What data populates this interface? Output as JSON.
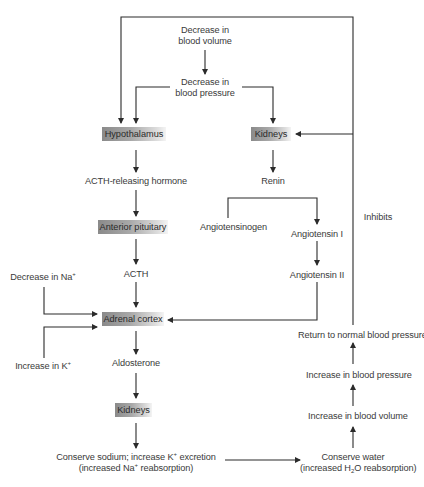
{
  "diagram": {
    "nodes": {
      "decrease_blood_volume": {
        "line1": "Decrease in",
        "line2": "blood volume"
      },
      "decrease_blood_pressure": {
        "line1": "Decrease in",
        "line2": "blood pressure"
      },
      "hypothalamus": "Hypothalamus",
      "kidneys_top": "Kidneys",
      "acth_releasing_hormone": "ACTH-releasing hormone",
      "renin": "Renin",
      "anterior_pituitary": "Anterior pituitary",
      "angiotensinogen": "Angiotensinogen",
      "angiotensin_1": "Angiotensin I",
      "angiotensin_2": "Angiotensin II",
      "inhibits": "Inhibits",
      "acth": "ACTH",
      "decrease_na": {
        "text": "Decrease in Na",
        "sup": "+"
      },
      "adrenal_cortex": "Adrenal cortex",
      "increase_k": {
        "text": "Increase in K",
        "sup": "+"
      },
      "aldosterone": "Aldosterone",
      "kidneys_bottom": "Kidneys",
      "return_normal_bp": "Return to normal blood pressure",
      "increase_bp": "Increase in blood pressure",
      "increase_bv": "Increase in blood volume",
      "conserve_sodium": {
        "a": "Conserve sodium; increase K",
        "sup1": "+",
        "b": " excretion",
        "c": "(increased Na",
        "sup2": "+",
        "d": " reabsorption)"
      },
      "conserve_water": {
        "line1": "Conserve water",
        "a": "(increased H",
        "sub": "2",
        "b": "O reabsorption)"
      }
    },
    "colors": {
      "line": "#2b2b2b",
      "box_dark": "#8a8a8a",
      "box_light": "#f4f4f4",
      "text": "#3a3a3a"
    }
  }
}
